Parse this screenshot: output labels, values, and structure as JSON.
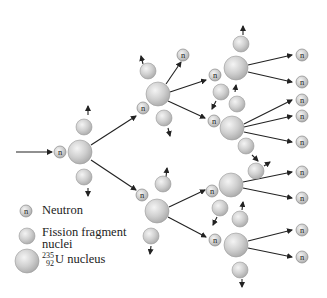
{
  "diagram": {
    "type": "nuclear fission chain reaction",
    "neutron_symbol": "n",
    "colors": {
      "nucleus_fill": "#c8c8c8",
      "nucleus_highlight": "#f2f2f2",
      "nucleus_stroke": "#8a8a8a",
      "arrow": "#222222",
      "text": "#222222"
    }
  },
  "legend": {
    "neutron": {
      "symbol": "n",
      "label": "Neutron"
    },
    "fragment": {
      "label_line1": "Fission fragment",
      "label_line2": "nuclei"
    },
    "uranium": {
      "mass_number": "235",
      "atomic_number": "92",
      "label": "U nucleus"
    }
  }
}
